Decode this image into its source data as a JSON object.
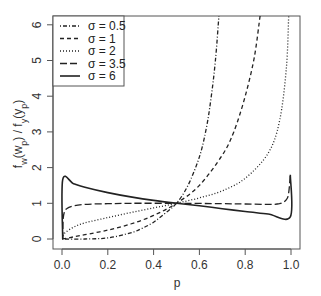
{
  "chart_data": {
    "type": "line",
    "title": "",
    "xlabel": "p",
    "ylabel": "f_w(w_p) / f_y(y_p)",
    "xlim": [
      -0.04,
      1.04
    ],
    "ylim": [
      -0.28,
      6.25
    ],
    "xticks": [
      "0.0",
      "0.2",
      "0.4",
      "0.6",
      "0.8",
      "1.0"
    ],
    "yticks": [
      "0",
      "1",
      "2",
      "3",
      "4",
      "5",
      "6"
    ],
    "grid": false,
    "legend_position": "top-left",
    "series": [
      {
        "name": "σ = 0.5",
        "label": "σ = 0.5",
        "style": "dotdash",
        "points": [
          [
            0.001,
            0
          ],
          [
            0.1,
            0.0
          ],
          [
            0.2,
            0.03
          ],
          [
            0.3,
            0.17
          ],
          [
            0.35,
            0.3
          ],
          [
            0.4,
            0.47
          ],
          [
            0.45,
            0.72
          ],
          [
            0.5,
            1.0
          ],
          [
            0.55,
            1.5
          ],
          [
            0.6,
            2.3
          ],
          [
            0.63,
            3.1
          ],
          [
            0.65,
            3.9
          ],
          [
            0.67,
            5.0
          ],
          [
            0.685,
            6.25
          ]
        ]
      },
      {
        "name": "σ = 1",
        "label": "σ = 1",
        "style": "dashed",
        "points": [
          [
            0.001,
            0
          ],
          [
            0.02,
            0.02
          ],
          [
            0.05,
            0.06
          ],
          [
            0.1,
            0.12
          ],
          [
            0.2,
            0.25
          ],
          [
            0.3,
            0.42
          ],
          [
            0.4,
            0.66
          ],
          [
            0.5,
            1.0
          ],
          [
            0.6,
            1.5
          ],
          [
            0.7,
            2.35
          ],
          [
            0.75,
            3.0
          ],
          [
            0.8,
            4.0
          ],
          [
            0.84,
            5.1
          ],
          [
            0.865,
            6.25
          ]
        ]
      },
      {
        "name": "σ = 2",
        "label": "σ = 2",
        "style": "dotted",
        "points": [
          [
            0.003,
            0
          ],
          [
            0.01,
            0.15
          ],
          [
            0.05,
            0.33
          ],
          [
            0.1,
            0.45
          ],
          [
            0.2,
            0.6
          ],
          [
            0.3,
            0.74
          ],
          [
            0.4,
            0.87
          ],
          [
            0.5,
            1.0
          ],
          [
            0.6,
            1.15
          ],
          [
            0.7,
            1.35
          ],
          [
            0.8,
            1.7
          ],
          [
            0.9,
            2.4
          ],
          [
            0.95,
            3.3
          ],
          [
            0.98,
            4.8
          ],
          [
            0.99,
            6.25
          ]
        ]
      },
      {
        "name": "σ = 3.5",
        "label": "σ = 3.5",
        "style": "longdash",
        "points": [
          [
            0.003,
            0
          ],
          [
            0.005,
            0.55
          ],
          [
            0.01,
            0.75
          ],
          [
            0.02,
            0.85
          ],
          [
            0.05,
            0.93
          ],
          [
            0.1,
            0.97
          ],
          [
            0.2,
            0.99
          ],
          [
            0.3,
            1.0
          ],
          [
            0.5,
            1.0
          ],
          [
            0.7,
            0.99
          ],
          [
            0.8,
            0.98
          ],
          [
            0.9,
            0.97
          ],
          [
            0.95,
            0.99
          ],
          [
            0.98,
            1.1
          ],
          [
            0.99,
            1.3
          ],
          [
            0.997,
            1.8
          ]
        ]
      },
      {
        "name": "σ = 6",
        "label": "σ = 6",
        "style": "solid",
        "points": [
          [
            0.003,
            0
          ],
          [
            0.003,
            1.66
          ],
          [
            0.05,
            1.55
          ],
          [
            0.1,
            1.45
          ],
          [
            0.2,
            1.3
          ],
          [
            0.3,
            1.18
          ],
          [
            0.4,
            1.08
          ],
          [
            0.5,
            1.0
          ],
          [
            0.6,
            0.93
          ],
          [
            0.7,
            0.85
          ],
          [
            0.8,
            0.77
          ],
          [
            0.9,
            0.7
          ],
          [
            0.997,
            0.62
          ],
          [
            0.997,
            1.8
          ]
        ]
      }
    ]
  },
  "legend": {
    "items": [
      {
        "label": "σ = 0.5",
        "style": "dotdash"
      },
      {
        "label": "σ = 1",
        "style": "dashed"
      },
      {
        "label": "σ = 2",
        "style": "dotted"
      },
      {
        "label": "σ = 3.5",
        "style": "longdash"
      },
      {
        "label": "σ = 6",
        "style": "solid"
      }
    ]
  },
  "axes": {
    "x_title": "p",
    "y_title_main": "f",
    "y_title": "f_w(w_p) / f_y(y_p)"
  },
  "colors": {
    "line": "#222222",
    "frame": "#555555",
    "text": "#333333"
  }
}
